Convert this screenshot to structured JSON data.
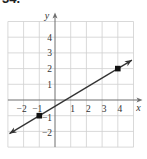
{
  "problem_label": "34.",
  "chart_data": {
    "type": "line",
    "title": "",
    "xlabel": "x",
    "ylabel": "y",
    "xlim": [
      -3,
      5
    ],
    "ylim": [
      -3,
      5
    ],
    "grid": true,
    "x_tick_labels": [
      "−2",
      "−1",
      "1",
      "2",
      "3",
      "4"
    ],
    "x_ticks": [
      -2,
      -1,
      1,
      2,
      3,
      4
    ],
    "y_tick_labels": [
      "4",
      "3",
      "2",
      "1",
      "−1",
      "−2"
    ],
    "y_ticks": [
      4,
      3,
      2,
      1,
      -1,
      -2
    ],
    "series": [
      {
        "name": "line",
        "x": [
          -1,
          4
        ],
        "y": [
          -1,
          2
        ],
        "marked_points": [
          [
            -1,
            -1
          ],
          [
            4,
            2
          ]
        ],
        "slope": 0.6,
        "arrows_both_ends": true
      }
    ],
    "colors": {
      "grid": "#cfcfcf",
      "axis": "#6e6e6e",
      "line": "#333333",
      "point": "#111111"
    }
  }
}
